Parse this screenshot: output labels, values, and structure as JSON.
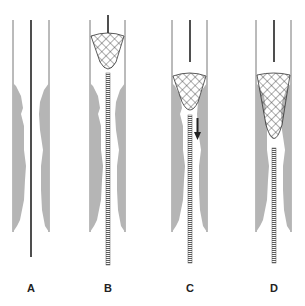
{
  "figure": {
    "type": "diagram",
    "colors": {
      "wall": "#777777",
      "plaque": "#b5b5b5",
      "wire": "#222222",
      "mesh": "#333333"
    },
    "panels": [
      {
        "id": "A",
        "label": "A",
        "wire_x": 31,
        "left_wall": 13,
        "right_wall": 49,
        "basket": null
      },
      {
        "id": "B",
        "label": "B",
        "wire_x": 108,
        "left_wall": 90,
        "right_wall": 125,
        "basket": {
          "top": 33,
          "bottom": 73
        },
        "arrow": false
      },
      {
        "id": "C",
        "label": "C",
        "wire_x": 190,
        "left_wall": 172,
        "right_wall": 207,
        "basket": {
          "top": 75,
          "bottom": 115
        },
        "arrow": true
      },
      {
        "id": "D",
        "label": "D",
        "wire_x": 274,
        "left_wall": 256,
        "right_wall": 291,
        "basket": {
          "top": 72,
          "bottom": 148
        },
        "arrow": false
      }
    ]
  }
}
